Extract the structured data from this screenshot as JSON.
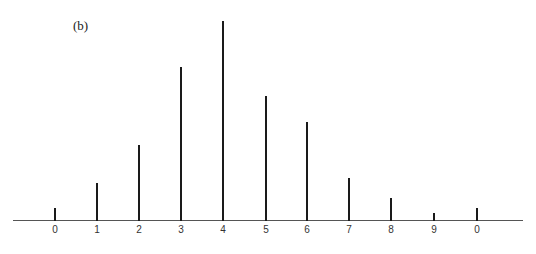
{
  "chart_data": {
    "type": "stem",
    "title": "",
    "panel_label": "(b)",
    "xlabel": "",
    "ylabel": "",
    "categories": [
      "0",
      "1",
      "2",
      "3",
      "4",
      "5",
      "6",
      "7",
      "8",
      "9",
      "0"
    ],
    "values": [
      13,
      38,
      76,
      154,
      200,
      125,
      99,
      43,
      23,
      8,
      13
    ],
    "value_units": "relative stem height (px-scale, max=200)",
    "ylim": [
      0,
      200
    ],
    "grid": false,
    "legend": null,
    "color": "#1a1a1a"
  },
  "layout": {
    "baseline_y": 221,
    "x_positions": [
      55,
      97,
      139,
      181,
      223,
      266,
      307,
      349,
      391,
      434,
      477
    ]
  }
}
